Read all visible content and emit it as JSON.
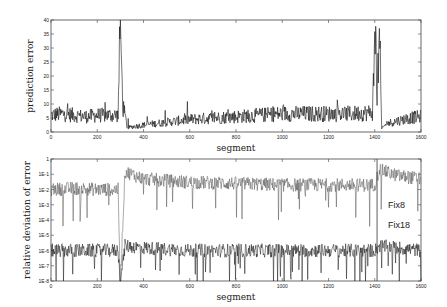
{
  "chart_data": [
    {
      "type": "line",
      "title": "",
      "xlabel": "segment",
      "ylabel": "prediction error",
      "xlim": [
        0,
        1600
      ],
      "ylim": [
        0,
        40
      ],
      "xticks": [
        "0",
        "200",
        "400",
        "600",
        "800",
        "1000",
        "1200",
        "1400",
        "1600"
      ],
      "yticks": [
        "0",
        "5",
        "10",
        "15",
        "20",
        "25",
        "30",
        "35",
        "40"
      ],
      "grid": false,
      "series": [
        {
          "name": "prediction error",
          "color": "#111111",
          "x": [
            0,
            50,
            100,
            150,
            200,
            250,
            290,
            300,
            310,
            330,
            360,
            400,
            500,
            600,
            700,
            800,
            900,
            1000,
            1100,
            1200,
            1300,
            1390,
            1405,
            1410,
            1420,
            1430,
            1450,
            1500,
            1550,
            1600
          ],
          "values": [
            6,
            6.5,
            6,
            5.5,
            6,
            6,
            6,
            40,
            10,
            1.5,
            2,
            2.5,
            3.5,
            4.5,
            5,
            5.5,
            6,
            6.5,
            6.5,
            6.5,
            6.5,
            7,
            40,
            12,
            37,
            1,
            3,
            4,
            5,
            5.5
          ]
        }
      ],
      "annotations": [
        {
          "x": 300,
          "text": "spike to 40"
        },
        {
          "x": 1410,
          "text": "spike to ~37"
        }
      ]
    },
    {
      "type": "line",
      "title": "",
      "xlabel": "segment",
      "ylabel": "relative deviation of error",
      "xlim": [
        0,
        1600
      ],
      "yscale": "log",
      "ylim": [
        1e-08,
        1
      ],
      "xticks": [
        "0",
        "200",
        "400",
        "600",
        "800",
        "1000",
        "1200",
        "1400",
        "1600"
      ],
      "yticks": [
        "1E-8",
        "1E-7",
        "1E-6",
        "1E-5",
        "1E-4",
        "1E-3",
        "1E-2",
        "1E-1",
        "1"
      ],
      "grid": false,
      "series": [
        {
          "name": "Fix8",
          "color": "#555555",
          "x": [
            0,
            100,
            200,
            290,
            300,
            320,
            400,
            600,
            800,
            1000,
            1200,
            1400,
            1420,
            1500,
            1600
          ],
          "values": [
            0.01,
            0.012,
            0.01,
            0.01,
            1e-08,
            0.15,
            0.05,
            0.03,
            0.025,
            0.02,
            0.02,
            0.02,
            0.2,
            0.08,
            0.05
          ]
        },
        {
          "name": "Fix18",
          "color": "#111111",
          "x": [
            0,
            100,
            200,
            290,
            300,
            320,
            400,
            600,
            800,
            1000,
            1200,
            1400,
            1420,
            1500,
            1600
          ],
          "values": [
            1e-06,
            1e-06,
            1e-06,
            1e-06,
            1e-08,
            2e-06,
            1.5e-06,
            1e-06,
            1e-06,
            1e-06,
            1e-06,
            1e-06,
            2e-06,
            1.5e-06,
            1e-06
          ]
        }
      ],
      "legend": [
        {
          "label": "Fix8",
          "position": "right, near 1E-3"
        },
        {
          "label": "Fix18",
          "position": "right, near 1E-5"
        }
      ]
    }
  ],
  "top": {
    "ylabel": "prediction error",
    "xlabel": "segment",
    "xticks": [
      "0",
      "200",
      "400",
      "600",
      "800",
      "1000",
      "1200",
      "1400",
      "1600"
    ],
    "yticks": [
      "0",
      "5",
      "10",
      "15",
      "20",
      "25",
      "30",
      "35",
      "40"
    ]
  },
  "bottom": {
    "ylabel": "relative deviation of error",
    "xlabel": "segment",
    "xticks": [
      "0",
      "200",
      "400",
      "600",
      "800",
      "1000",
      "1200",
      "1400",
      "1600"
    ],
    "yticks": [
      "1E-8",
      "1E-7",
      "1E-6",
      "1E-5",
      "1E-4",
      "1E-3",
      "1E-2",
      "1E-1",
      "1"
    ],
    "series_labels": [
      "Fix8",
      "Fix18"
    ]
  }
}
